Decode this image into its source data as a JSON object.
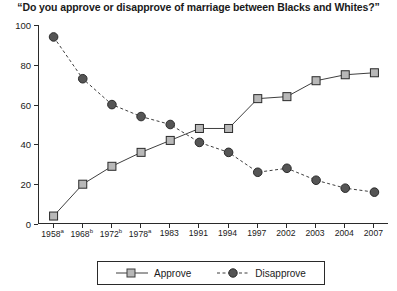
{
  "chart_data": {
    "type": "line",
    "title": "“Do you approve or disapprove of marriage between Blacks and Whites?”",
    "xlabel": "",
    "ylabel": "",
    "ylim": [
      0,
      100
    ],
    "yticks": [
      0,
      20,
      40,
      60,
      80,
      100
    ],
    "grid": false,
    "legend_position": "bottom",
    "categories": [
      "1958",
      "1968",
      "1972",
      "1978",
      "1983",
      "1991",
      "1994",
      "1997",
      "2002",
      "2003",
      "2004",
      "2007"
    ],
    "category_notes": [
      "a",
      "b",
      "b",
      "a",
      "",
      "",
      "",
      "",
      "",
      "",
      "",
      ""
    ],
    "series": [
      {
        "name": "Approve",
        "marker": "open-square",
        "line_style": "solid",
        "color": "#3f3f3f",
        "marker_fill": "#b8b8b8",
        "values": [
          4,
          20,
          29,
          36,
          42,
          48,
          48,
          63,
          64,
          72,
          75,
          76
        ]
      },
      {
        "name": "Disapprove",
        "marker": "filled-circle",
        "line_style": "dashed",
        "color": "#3f3f3f",
        "marker_fill": "#555555",
        "values": [
          94,
          73,
          60,
          54,
          50,
          41,
          36,
          26,
          28,
          22,
          18,
          16
        ]
      }
    ]
  },
  "legend": {
    "approve_label": "Approve",
    "disapprove_label": "Disapprove"
  }
}
